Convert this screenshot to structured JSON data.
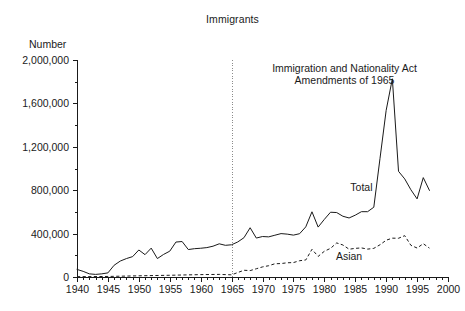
{
  "chart_data": {
    "type": "line",
    "title": "Immigrants",
    "ylabel": "Number",
    "xlabel": "",
    "xlim": [
      1940,
      2000
    ],
    "ylim": [
      0,
      2000000
    ],
    "grid": false,
    "legend_position": "inline-annotation",
    "y_ticks": [
      0,
      400000,
      800000,
      1200000,
      1600000,
      2000000
    ],
    "y_tick_labels": [
      "0",
      "400,000",
      "800,000",
      "1,200,000",
      "1,600,000",
      "2,000,000"
    ],
    "x_ticks": [
      1940,
      1945,
      1950,
      1955,
      1960,
      1965,
      1970,
      1975,
      1980,
      1985,
      1990,
      1995,
      2000
    ],
    "x_tick_labels": [
      "1940",
      "1945",
      "1950",
      "1955",
      "1960",
      "1965",
      "1970",
      "1975",
      "1980",
      "1985",
      "1990",
      "1995",
      "2000"
    ],
    "x_minor_tick_step": 1,
    "y_minor_tick_step": 200000,
    "annotations": [
      {
        "name": "immigration-act-1965",
        "line1": "Immigration and Nationality Act",
        "line2": "Amendments of 1965",
        "x": 1965,
        "style": "vertical-dotted-line"
      }
    ],
    "series": [
      {
        "name": "Total",
        "style": "solid",
        "label_x": 1986,
        "label_y": 790000,
        "x": [
          1940,
          1941,
          1942,
          1943,
          1944,
          1945,
          1946,
          1947,
          1948,
          1949,
          1950,
          1951,
          1952,
          1953,
          1954,
          1955,
          1956,
          1957,
          1958,
          1959,
          1960,
          1961,
          1962,
          1963,
          1964,
          1965,
          1966,
          1967,
          1968,
          1969,
          1970,
          1971,
          1972,
          1973,
          1974,
          1975,
          1976,
          1977,
          1978,
          1979,
          1980,
          1981,
          1982,
          1983,
          1984,
          1985,
          1986,
          1987,
          1988,
          1989,
          1990,
          1991,
          1992,
          1993,
          1994,
          1995,
          1996,
          1997
        ],
        "values": [
          70000,
          52000,
          29000,
          24000,
          29000,
          38000,
          108000,
          147000,
          170000,
          188000,
          249000,
          206000,
          266000,
          170000,
          208000,
          238000,
          322000,
          327000,
          253000,
          261000,
          265000,
          271000,
          284000,
          306000,
          292000,
          297000,
          323000,
          362000,
          454000,
          359000,
          373000,
          370000,
          385000,
          400000,
          395000,
          386000,
          399000,
          462000,
          601000,
          460000,
          531000,
          597000,
          594000,
          560000,
          544000,
          570000,
          602000,
          602000,
          643000,
          1091000,
          1536000,
          1827000,
          974000,
          904000,
          804000,
          720000,
          916000,
          798000
        ]
      },
      {
        "name": "Asian",
        "style": "dashed",
        "label_x": 1984,
        "label_y": 155000,
        "x": [
          1940,
          1945,
          1950,
          1955,
          1960,
          1963,
          1965,
          1966,
          1967,
          1968,
          1969,
          1970,
          1971,
          1972,
          1973,
          1974,
          1975,
          1976,
          1977,
          1978,
          1979,
          1980,
          1981,
          1982,
          1983,
          1984,
          1985,
          1986,
          1987,
          1988,
          1989,
          1990,
          1991,
          1992,
          1993,
          1994,
          1995,
          1996,
          1997
        ],
        "values": [
          3000,
          5000,
          11000,
          16000,
          22000,
          24000,
          20000,
          41000,
          62000,
          59000,
          76000,
          93000,
          104000,
          122000,
          124000,
          131000,
          133000,
          150000,
          157000,
          255000,
          190000,
          237000,
          264000,
          314000,
          295000,
          256000,
          264000,
          268000,
          257000,
          264000,
          297000,
          339000,
          358000,
          357000,
          381000,
          292000,
          267000,
          307000,
          266000
        ]
      }
    ]
  }
}
